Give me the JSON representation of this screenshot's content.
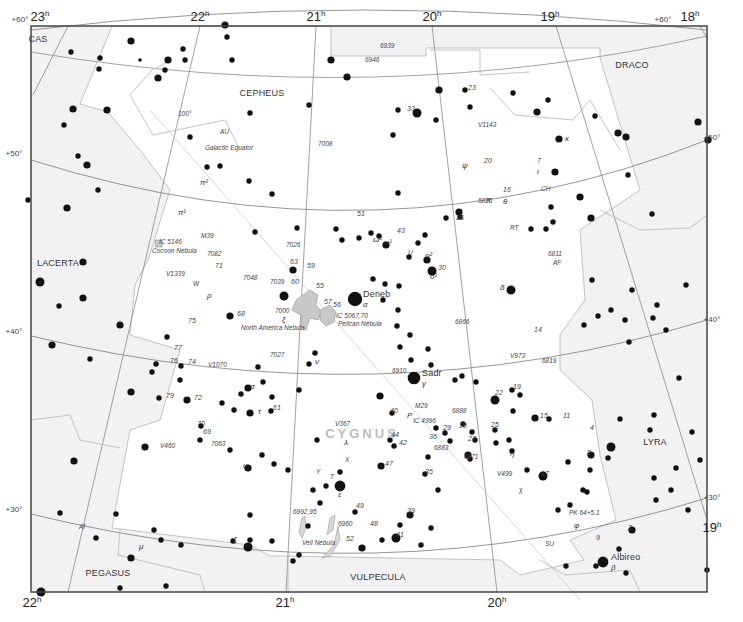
{
  "map": {
    "title": "Cygnus star chart",
    "main_constellation": "CYGNUS",
    "colors": {
      "outside_fill": "#f2f2f2",
      "inside_fill": "#ffffff",
      "border": "#444444",
      "grid": "#8a8a8a",
      "boundary": "#b5b5b5",
      "nebula": "#c8c8c8",
      "star": "#111111",
      "main_label": "#bbbbbb"
    },
    "ra_labels_top": [
      {
        "x": 40,
        "text": "23",
        "sup": "h"
      },
      {
        "x": 200,
        "text": "22",
        "sup": "h"
      },
      {
        "x": 316,
        "text": "21",
        "sup": "h"
      },
      {
        "x": 432,
        "text": "20",
        "sup": "h"
      },
      {
        "x": 550,
        "text": "19",
        "sup": "h"
      },
      {
        "x": 690,
        "text": "18",
        "sup": "h"
      }
    ],
    "ra_labels_bottom": [
      {
        "x": 32,
        "text": "22",
        "sup": "h"
      },
      {
        "x": 285,
        "text": "21",
        "sup": "h"
      },
      {
        "x": 497,
        "text": "20",
        "sup": "h"
      },
      {
        "x": 712,
        "text": "19",
        "sup": "h",
        "y": 532
      }
    ],
    "dec_labels": [
      {
        "x": 20,
        "y": 22,
        "text": "+60°"
      },
      {
        "x": 663,
        "y": 22,
        "text": "+60°"
      },
      {
        "x": 14,
        "y": 156,
        "text": "+50°"
      },
      {
        "x": 712,
        "y": 140,
        "text": "+50°"
      },
      {
        "x": 14,
        "y": 334,
        "text": "+40°"
      },
      {
        "x": 712,
        "y": 322,
        "text": "+40°"
      },
      {
        "x": 14,
        "y": 512,
        "text": "+30°"
      },
      {
        "x": 712,
        "y": 500,
        "text": "+30°"
      }
    ],
    "constellations": [
      {
        "name": "CAS",
        "x": 38,
        "y": 42
      },
      {
        "name": "CEPHEUS",
        "x": 262,
        "y": 96
      },
      {
        "name": "DRACO",
        "x": 632,
        "y": 68
      },
      {
        "name": "LACERTA",
        "x": 58,
        "y": 266
      },
      {
        "name": "LYRA",
        "x": 655,
        "y": 445
      },
      {
        "name": "PEGASUS",
        "x": 108,
        "y": 576
      },
      {
        "name": "VULPECULA",
        "x": 378,
        "y": 580
      }
    ],
    "named_stars": [
      {
        "name": "Deneb",
        "greek": "α",
        "x": 355,
        "y": 299
      },
      {
        "name": "Sadr",
        "greek": "γ",
        "x": 414,
        "y": 378
      },
      {
        "name": "Albireo",
        "greek": "β",
        "x": 603,
        "y": 562
      }
    ],
    "deep_sky_labels": [
      {
        "text": "6939",
        "x": 380,
        "y": 48
      },
      {
        "text": "6946",
        "x": 365,
        "y": 62
      },
      {
        "text": "7008",
        "x": 318,
        "y": 146
      },
      {
        "text": "6826",
        "x": 478,
        "y": 203
      },
      {
        "text": "6811",
        "x": 548,
        "y": 256
      },
      {
        "text": "M39",
        "x": 201,
        "y": 238
      },
      {
        "text": "IC 5146",
        "x": 159,
        "y": 244
      },
      {
        "text": "Cocoon Nebula",
        "x": 152,
        "y": 253
      },
      {
        "text": "7082",
        "x": 207,
        "y": 256
      },
      {
        "text": "7026",
        "x": 286,
        "y": 247
      },
      {
        "text": "7048",
        "x": 243,
        "y": 280
      },
      {
        "text": "7039",
        "x": 270,
        "y": 284
      },
      {
        "text": "7000",
        "x": 275,
        "y": 313
      },
      {
        "text": "North America Nebula",
        "x": 241,
        "y": 330
      },
      {
        "text": "IC 5067,70",
        "x": 336,
        "y": 318
      },
      {
        "text": "Pelican Nebula",
        "x": 338,
        "y": 326
      },
      {
        "text": "6866",
        "x": 455,
        "y": 324
      },
      {
        "text": "6819",
        "x": 542,
        "y": 363
      },
      {
        "text": "7027",
        "x": 270,
        "y": 357
      },
      {
        "text": "6910",
        "x": 392,
        "y": 373
      },
      {
        "text": "M29",
        "x": 415,
        "y": 408
      },
      {
        "text": "6888",
        "x": 452,
        "y": 413
      },
      {
        "text": "IC 4996",
        "x": 413,
        "y": 423
      },
      {
        "text": "6883",
        "x": 434,
        "y": 450
      },
      {
        "text": "6871",
        "x": 464,
        "y": 459
      },
      {
        "text": "7063",
        "x": 211,
        "y": 446
      },
      {
        "text": "6992,95",
        "x": 293,
        "y": 514
      },
      {
        "text": "6960",
        "x": 338,
        "y": 526
      },
      {
        "text": "Veil Nebula",
        "x": 302,
        "y": 545
      },
      {
        "text": "PK 64+5.1",
        "x": 569,
        "y": 515
      },
      {
        "text": "Galactic Equator",
        "x": 205,
        "y": 150
      },
      {
        "text": "100°",
        "x": 178,
        "y": 116
      }
    ],
    "variable_labels": [
      {
        "text": "AU",
        "x": 220,
        "y": 134
      },
      {
        "text": "V1143",
        "x": 478,
        "y": 127
      },
      {
        "text": "RT",
        "x": 510,
        "y": 230
      },
      {
        "text": "AF",
        "x": 553,
        "y": 265
      },
      {
        "text": "U",
        "x": 408,
        "y": 255
      },
      {
        "text": "V1339",
        "x": 166,
        "y": 276
      },
      {
        "text": "W",
        "x": 193,
        "y": 286
      },
      {
        "text": "V1070",
        "x": 208,
        "y": 367
      },
      {
        "text": "V973",
        "x": 510,
        "y": 358
      },
      {
        "text": "V367",
        "x": 335,
        "y": 426
      },
      {
        "text": "V460",
        "x": 160,
        "y": 448
      },
      {
        "text": "X",
        "x": 345,
        "y": 462
      },
      {
        "text": "Y",
        "x": 316,
        "y": 474
      },
      {
        "text": "T",
        "x": 330,
        "y": 479
      },
      {
        "text": "V499",
        "x": 497,
        "y": 476
      },
      {
        "text": "χ",
        "x": 519,
        "y": 492
      },
      {
        "text": "SU",
        "x": 545,
        "y": 546
      },
      {
        "text": "CH",
        "x": 541,
        "y": 191
      },
      {
        "text": "R",
        "x": 486,
        "y": 203
      },
      {
        "text": "Af",
        "x": 79,
        "y": 529
      }
    ],
    "flamsteed_labels": [
      {
        "text": "23",
        "x": 468,
        "y": 90
      },
      {
        "text": "33",
        "x": 407,
        "y": 111
      },
      {
        "text": "20",
        "x": 484,
        "y": 163
      },
      {
        "text": "7",
        "x": 537,
        "y": 163
      },
      {
        "text": "16",
        "x": 503,
        "y": 192
      },
      {
        "text": "26",
        "x": 456,
        "y": 220
      },
      {
        "text": "51",
        "x": 357,
        "y": 216
      },
      {
        "text": "43",
        "x": 397,
        "y": 233
      },
      {
        "text": "30",
        "x": 438,
        "y": 270
      },
      {
        "text": "63",
        "x": 290,
        "y": 264
      },
      {
        "text": "59",
        "x": 307,
        "y": 268
      },
      {
        "text": "60",
        "x": 291,
        "y": 284
      },
      {
        "text": "55",
        "x": 316,
        "y": 288
      },
      {
        "text": "57",
        "x": 324,
        "y": 304
      },
      {
        "text": "56",
        "x": 333,
        "y": 307
      },
      {
        "text": "71",
        "x": 215,
        "y": 268
      },
      {
        "text": "68",
        "x": 237,
        "y": 316
      },
      {
        "text": "75",
        "x": 188,
        "y": 323
      },
      {
        "text": "14",
        "x": 534,
        "y": 332
      },
      {
        "text": "77",
        "x": 174,
        "y": 350
      },
      {
        "text": "76",
        "x": 170,
        "y": 363
      },
      {
        "text": "74",
        "x": 188,
        "y": 364
      },
      {
        "text": "79",
        "x": 166,
        "y": 398
      },
      {
        "text": "72",
        "x": 194,
        "y": 400
      },
      {
        "text": "61",
        "x": 273,
        "y": 410
      },
      {
        "text": "70",
        "x": 197,
        "y": 426
      },
      {
        "text": "69",
        "x": 203,
        "y": 434
      },
      {
        "text": "19",
        "x": 513,
        "y": 389
      },
      {
        "text": "22",
        "x": 495,
        "y": 395
      },
      {
        "text": "15",
        "x": 540,
        "y": 418
      },
      {
        "text": "11",
        "x": 563,
        "y": 418
      },
      {
        "text": "40",
        "x": 390,
        "y": 413
      },
      {
        "text": "25",
        "x": 491,
        "y": 427
      },
      {
        "text": "29",
        "x": 443,
        "y": 430
      },
      {
        "text": "28",
        "x": 459,
        "y": 428
      },
      {
        "text": "36",
        "x": 429,
        "y": 439
      },
      {
        "text": "27",
        "x": 468,
        "y": 441
      },
      {
        "text": "44",
        "x": 391,
        "y": 437
      },
      {
        "text": "42",
        "x": 399,
        "y": 445
      },
      {
        "text": "4",
        "x": 590,
        "y": 430
      },
      {
        "text": "8",
        "x": 587,
        "y": 455
      },
      {
        "text": "17",
        "x": 541,
        "y": 476
      },
      {
        "text": "47",
        "x": 385,
        "y": 466
      },
      {
        "text": "35",
        "x": 425,
        "y": 474
      },
      {
        "text": "49",
        "x": 356,
        "y": 508
      },
      {
        "text": "48",
        "x": 370,
        "y": 526
      },
      {
        "text": "39",
        "x": 407,
        "y": 513
      },
      {
        "text": "52",
        "x": 346,
        "y": 541
      },
      {
        "text": "41",
        "x": 396,
        "y": 537
      },
      {
        "text": "2",
        "x": 628,
        "y": 530
      },
      {
        "text": "9",
        "x": 596,
        "y": 540
      }
    ],
    "greek_labels": [
      {
        "text": "κ",
        "x": 565,
        "y": 141
      },
      {
        "text": "ι",
        "x": 537,
        "y": 174
      },
      {
        "text": "θ",
        "x": 503,
        "y": 204
      },
      {
        "text": "ψ",
        "x": 462,
        "y": 168
      },
      {
        "text": "π²",
        "x": 200,
        "y": 185
      },
      {
        "text": "π¹",
        "x": 178,
        "y": 215
      },
      {
        "text": "ω²",
        "x": 373,
        "y": 242
      },
      {
        "text": "ω¹",
        "x": 383,
        "y": 245
      },
      {
        "text": "o²",
        "x": 425,
        "y": 258
      },
      {
        "text": "o¹",
        "x": 430,
        "y": 279
      },
      {
        "text": "δ",
        "x": 500,
        "y": 290
      },
      {
        "text": "ρ",
        "x": 207,
        "y": 298
      },
      {
        "text": "ξ",
        "x": 282,
        "y": 322
      },
      {
        "text": "ν",
        "x": 315,
        "y": 364
      },
      {
        "text": "σ",
        "x": 250,
        "y": 389
      },
      {
        "text": "τ",
        "x": 258,
        "y": 414
      },
      {
        "text": "λ",
        "x": 344,
        "y": 445
      },
      {
        "text": "P",
        "x": 407,
        "y": 418
      },
      {
        "text": "η",
        "x": 510,
        "y": 456
      },
      {
        "text": "υ",
        "x": 243,
        "y": 468
      },
      {
        "text": "ε",
        "x": 338,
        "y": 497
      },
      {
        "text": "ζ",
        "x": 233,
        "y": 542
      },
      {
        "text": "μ",
        "x": 139,
        "y": 549
      },
      {
        "text": "φ",
        "x": 574,
        "y": 528
      }
    ]
  },
  "chart_data": {
    "type": "map",
    "title": "Cygnus",
    "ra_range_hours": [
      18,
      23
    ],
    "dec_range_deg": [
      27,
      61
    ],
    "dec_gridlines": [
      "+30°",
      "+40°",
      "+50°",
      "+60°"
    ],
    "ra_gridlines": [
      "18h",
      "19h",
      "20h",
      "21h",
      "22h",
      "23h"
    ],
    "neighbors": [
      "CAS",
      "CEPHEUS",
      "DRACO",
      "LACERTA",
      "LYRA",
      "PEGASUS",
      "VULPECULA"
    ]
  }
}
